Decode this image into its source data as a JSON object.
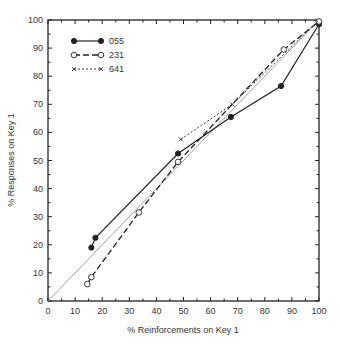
{
  "chart_data": {
    "type": "line",
    "title": "",
    "xlabel": "% Reinforcements on Key 1",
    "ylabel": "% Responses on Key 1",
    "xlim": [
      0,
      100
    ],
    "ylim": [
      0,
      100
    ],
    "xticks": [
      0,
      10,
      20,
      30,
      40,
      50,
      60,
      70,
      80,
      90,
      100
    ],
    "yticks": [
      0,
      10,
      20,
      30,
      40,
      50,
      60,
      70,
      80,
      90,
      100
    ],
    "grid": false,
    "legend_position": "upper-left",
    "reference_line": {
      "name": "matching diagonal",
      "x": [
        0,
        100
      ],
      "y": [
        0,
        100
      ]
    },
    "series": [
      {
        "name": "055",
        "style": "solid",
        "marker": "filled-circle",
        "x": [
          16,
          17.5,
          48,
          67.5,
          86,
          100
        ],
        "y": [
          19,
          22.5,
          52.5,
          65.5,
          76.5,
          98.5
        ]
      },
      {
        "name": "231",
        "style": "dashed",
        "marker": "open-circle",
        "x": [
          14.5,
          16,
          33.5,
          48,
          87,
          100
        ],
        "y": [
          6,
          8.5,
          31.5,
          49.5,
          89.5,
          99.5
        ]
      },
      {
        "name": "641",
        "style": "dotted",
        "marker": "x",
        "x": [
          49,
          68,
          100
        ],
        "y": [
          57.5,
          70,
          100
        ]
      }
    ]
  },
  "colors": {
    "axis": "#222222",
    "series": "#222222",
    "reference": "#888888"
  }
}
